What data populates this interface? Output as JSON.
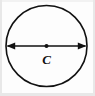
{
  "figure": {
    "name": "circle-with-diameter",
    "background_color": "#fdfdfd",
    "stroke_color": "#111111",
    "labels": {
      "center_point": "C"
    },
    "geometry": {
      "circle": {
        "cx": 46.5,
        "cy": 46,
        "r": 40.5,
        "stroke_width": 1.6
      },
      "center_dot": {
        "cx": 46.5,
        "cy": 46,
        "r": 2.0
      },
      "diameter_arrow": {
        "x1": 7.5,
        "x2": 85.5,
        "y": 46,
        "stroke_width": 1.4,
        "arrowhead_length": 8,
        "arrowhead_half_width": 3.6,
        "double_headed": true
      },
      "center_label_position": {
        "x": 46.5,
        "y": 64,
        "font_size": 13
      }
    }
  }
}
